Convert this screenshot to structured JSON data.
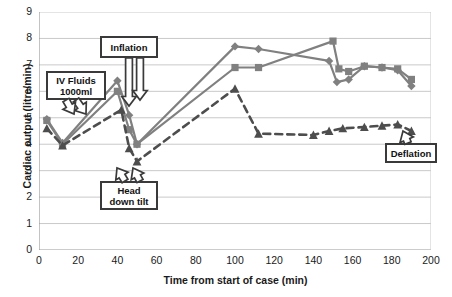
{
  "chart_data": {
    "type": "line",
    "title": "",
    "xlabel": "Time from start of case (min)",
    "ylabel": "Cardiac output (litre/min)",
    "xlim": [
      0,
      200
    ],
    "ylim": [
      0,
      9
    ],
    "xticks": [
      0,
      20,
      40,
      60,
      80,
      100,
      120,
      140,
      160,
      180,
      200
    ],
    "yticks": [
      0,
      1,
      2,
      3,
      4,
      5,
      6,
      7,
      8,
      9
    ],
    "grid": "horizontal",
    "legend": "none",
    "series": [
      {
        "name": "series-diamond",
        "marker": "diamond",
        "linestyle": "solid",
        "color": "#808080",
        "x": [
          4,
          12,
          40,
          46,
          50,
          100,
          112,
          148,
          152,
          158,
          166,
          175,
          183,
          190
        ],
        "y": [
          4.95,
          4.05,
          6.4,
          5.1,
          4.0,
          7.7,
          7.6,
          7.15,
          6.35,
          6.45,
          6.95,
          6.9,
          6.8,
          6.2
        ]
      },
      {
        "name": "series-square",
        "marker": "square",
        "linestyle": "solid",
        "color": "#808080",
        "x": [
          4,
          12,
          40,
          46,
          50,
          100,
          112,
          150,
          153,
          158,
          166,
          175,
          183,
          190
        ],
        "y": [
          4.9,
          4.0,
          6.0,
          4.55,
          4.0,
          6.9,
          6.9,
          7.9,
          6.85,
          6.75,
          6.95,
          6.9,
          6.85,
          6.45
        ]
      },
      {
        "name": "series-triangle-dashed",
        "marker": "triangle",
        "linestyle": "dashed",
        "color": "#4d4d4d",
        "x": [
          4,
          12,
          42,
          46,
          50,
          100,
          112,
          140,
          148,
          155,
          166,
          175,
          183,
          190
        ],
        "y": [
          4.6,
          3.95,
          5.3,
          3.85,
          3.35,
          6.1,
          4.4,
          4.35,
          4.5,
          4.6,
          4.65,
          4.7,
          4.75,
          4.5
        ]
      }
    ],
    "annotations": [
      {
        "name": "iv-fluids",
        "label": "IV Fluids\n1000ml",
        "text_line1": "IV Fluids",
        "text_line2": "1000ml",
        "points_to_x": 38,
        "points_to_y": 5.55
      },
      {
        "name": "inflation",
        "label": "Inflation",
        "text_line1": "Inflation",
        "text_line2": "",
        "points_to_x": 49,
        "points_to_y": 5.1
      },
      {
        "name": "head-down-tilt",
        "label": "Head\ndown tilt",
        "text_line1": "Head",
        "text_line2": "down tilt",
        "points_to_x": 44,
        "points_to_y": 3.3
      },
      {
        "name": "deflation",
        "label": "Deflation",
        "text_line1": "Deflation",
        "text_line2": "",
        "points_to_x": 183,
        "points_to_y": 4.6
      }
    ]
  }
}
